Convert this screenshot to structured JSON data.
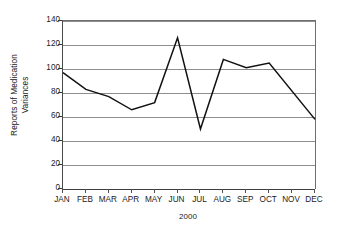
{
  "chart_data": {
    "type": "line",
    "title": "",
    "xlabel": "2000",
    "ylabel": "Reports of Medication Variances",
    "ylabel_line1": "Reports of Medication",
    "ylabel_line2": "Variances",
    "categories": [
      "JAN",
      "FEB",
      "MAR",
      "APR",
      "MAY",
      "JUN",
      "JUL",
      "AUG",
      "SEP",
      "OCT",
      "NOV",
      "DEC"
    ],
    "values": [
      97,
      83,
      77,
      66,
      72,
      126,
      50,
      108,
      101,
      105,
      82,
      58
    ],
    "vertex_months": [
      "JAN",
      "FEB",
      "MAR",
      "APR",
      "MAY",
      "JUN",
      "JUL",
      "AUG",
      "SEP",
      "OCT",
      "DEC"
    ],
    "series": [
      {
        "name": "Reports of Medication Variances",
        "values": [
          97,
          83,
          77,
          66,
          72,
          126,
          50,
          108,
          101,
          105,
          82,
          58
        ]
      }
    ],
    "ylim": [
      0,
      140
    ],
    "ytick_values": [
      0,
      20,
      40,
      60,
      80,
      100,
      120,
      140
    ],
    "ytick_labels": [
      "0",
      "20",
      "40",
      "60",
      "80",
      "100",
      "120",
      "140"
    ],
    "ytick_step": 20,
    "grid": "horizontal",
    "legend": "none",
    "line_color": "#111111",
    "grid_color": "#8e8e8e",
    "axis_color": "#3f3f3f",
    "background_color": "#ffffff",
    "markers": "none"
  },
  "axis": {
    "y_title_line1": "Reports of Medication",
    "y_title_line2": "Variances",
    "x_title": "2000"
  }
}
